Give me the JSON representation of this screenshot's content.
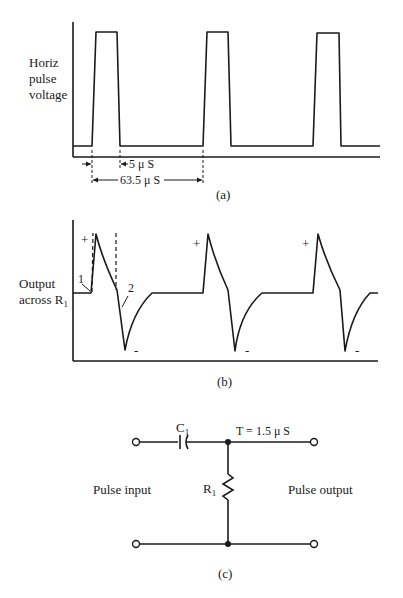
{
  "panel_a": {
    "ylabel_lines": [
      "Horiz",
      "pulse",
      "voltage"
    ],
    "pulse_width": "5 μ S",
    "period": "63.5 μ S",
    "caption": "(a)"
  },
  "panel_b": {
    "ylabel_line1": "Output",
    "ylabel_line2": "across R",
    "ylabel_sub": "1",
    "plus": "+",
    "minus": "-",
    "marker_1": "1",
    "marker_2": "2",
    "caption": "(b)"
  },
  "panel_c": {
    "capacitor_label": "C",
    "capacitor_sub": "1",
    "time_constant": "T = 1.5 μ S",
    "resistor_label": "R",
    "resistor_sub": "1",
    "input_label": "Pulse input",
    "output_label": "Pulse output",
    "caption": "(c)"
  }
}
